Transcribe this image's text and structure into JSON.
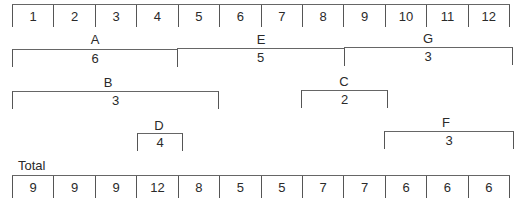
{
  "months": [
    "1",
    "2",
    "3",
    "4",
    "5",
    "6",
    "7",
    "8",
    "9",
    "10",
    "11",
    "12"
  ],
  "activities": [
    {
      "name": "A",
      "value": "6",
      "start": 1,
      "end": 4
    },
    {
      "name": "E",
      "value": "5",
      "start": 5,
      "end": 8
    },
    {
      "name": "G",
      "value": "3",
      "start": 9,
      "end": 12
    },
    {
      "name": "B",
      "value": "3",
      "start": 1,
      "end": 5
    },
    {
      "name": "C",
      "value": "2",
      "start": 8,
      "end": 9
    },
    {
      "name": "D",
      "value": "4",
      "start": 4,
      "end": 4
    },
    {
      "name": "F",
      "value": "3",
      "start": 10,
      "end": 12
    }
  ],
  "total": {
    "label": "Total",
    "values": [
      "9",
      "9",
      "9",
      "12",
      "8",
      "5",
      "5",
      "7",
      "7",
      "6",
      "6",
      "6"
    ]
  }
}
